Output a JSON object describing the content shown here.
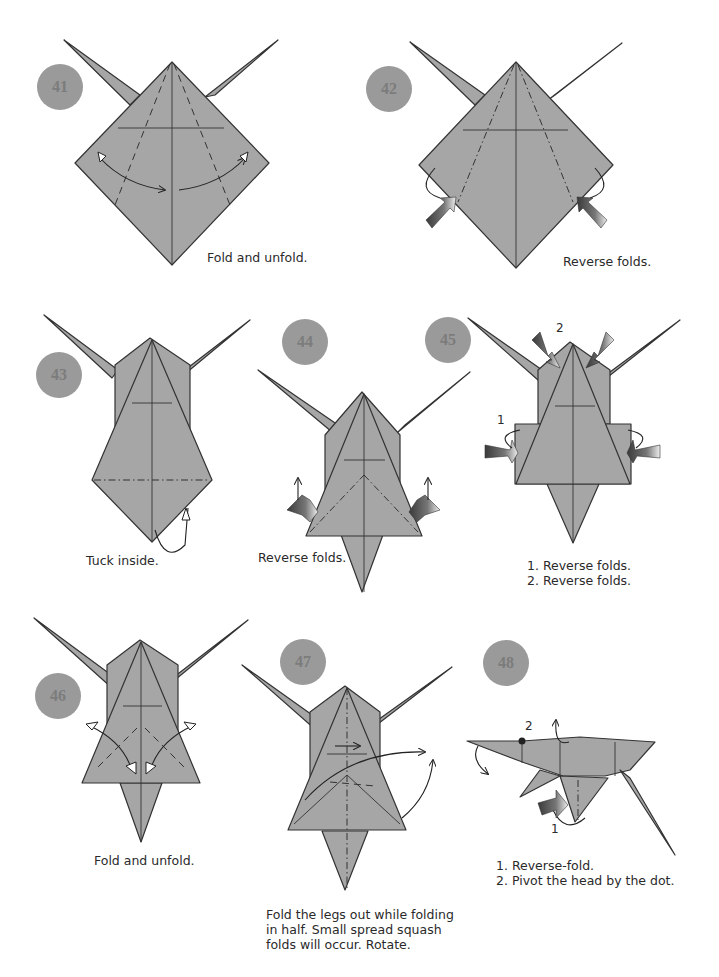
{
  "page": {
    "background": "#ffffff",
    "paper_color": "#a6a6a6",
    "badge_color": "#9a9a9a"
  },
  "steps": [
    {
      "number": "41",
      "caption": "Fold and unfold."
    },
    {
      "number": "42",
      "caption": "Reverse folds."
    },
    {
      "number": "43",
      "caption": "Tuck inside."
    },
    {
      "number": "44",
      "caption": "Reverse folds."
    },
    {
      "number": "45",
      "caption": "1. Reverse folds.\n2. Reverse folds.",
      "labels": [
        "1",
        "2"
      ]
    },
    {
      "number": "46",
      "caption": "Fold and unfold."
    },
    {
      "number": "47",
      "caption": "Fold the legs out while folding\nin half. Small spread squash\nfolds will occur. Rotate."
    },
    {
      "number": "48",
      "caption": "1. Reverse-fold.\n2. Pivot the head by the dot.",
      "labels": [
        "1",
        "2"
      ]
    }
  ],
  "icons": {
    "step_badge": "circle-number",
    "push_arrow": "reverse-fold-push-arrow",
    "fold_arrow": "curved-fold-arrow"
  }
}
